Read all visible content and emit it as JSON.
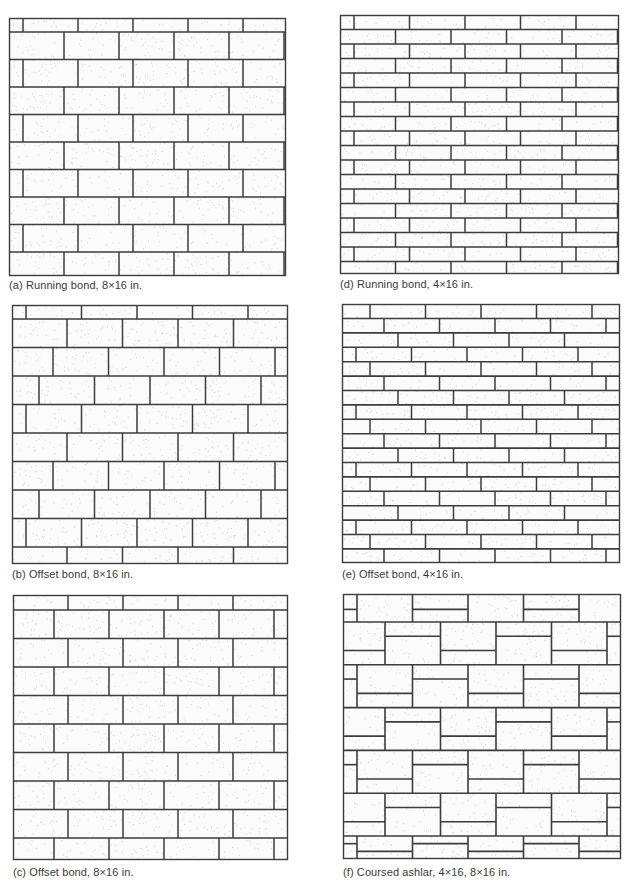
{
  "figure": {
    "background": "#ffffff",
    "line_color": "#3d3d3d",
    "brick_fill": "#fbfbfb",
    "stipple_color": "#9a9a9a",
    "panels": [
      {
        "id": "a",
        "caption": "(a) Running bond, 8×16 in.",
        "pattern": "running-bond",
        "unit": "8x16 in.",
        "box": {
          "x": 9,
          "y": 18,
          "w": 277,
          "h": 258
        },
        "caption_pos": {
          "x": 9,
          "y": 279
        },
        "brick_w": 55,
        "first_row_h": 14,
        "row_h": 27.5,
        "row_offsets": [
          14,
          0
        ],
        "base_offset": 14
      },
      {
        "id": "d",
        "caption": "(d) Running bond, 4×16 in.",
        "pattern": "running-bond",
        "unit": "4x16 in.",
        "box": {
          "x": 340,
          "y": 15,
          "w": 279,
          "h": 259
        },
        "caption_pos": {
          "x": 340,
          "y": 278
        },
        "brick_w": 55.5,
        "first_row_h": 14.5,
        "row_h": 14.5,
        "row_offsets": [
          14,
          0
        ],
        "base_offset": 14
      },
      {
        "id": "b",
        "caption": "(b) Offset bond, 8×16 in.",
        "pattern": "offset-bond-stepped-left",
        "unit": "8x16 in.",
        "box": {
          "x": 12,
          "y": 305,
          "w": 276,
          "h": 259
        },
        "caption_pos": {
          "x": 12,
          "y": 568
        },
        "brick_w": 55.5,
        "first_row_h": 14,
        "row_h": 28.5,
        "row_offsets": [
          14,
          55,
          41,
          27
        ],
        "base_offset": 14
      },
      {
        "id": "e",
        "caption": "(e) Offset bond, 4×16 in.",
        "pattern": "offset-bond-stepped-right",
        "unit": "4x16 in.",
        "box": {
          "x": 342,
          "y": 304,
          "w": 278,
          "h": 259
        },
        "caption_pos": {
          "x": 342,
          "y": 568
        },
        "brick_w": 55.5,
        "first_row_h": 14.5,
        "row_h": 14.4,
        "row_offsets": [
          28,
          42,
          56,
          14
        ],
        "base_offset": 28
      },
      {
        "id": "c",
        "caption": "(c) Offset bond, 8×16 in.",
        "pattern": "offset-bond-alternating",
        "unit": "8x16 in.",
        "box": {
          "x": 13,
          "y": 595,
          "w": 275,
          "h": 265
        },
        "caption_pos": {
          "x": 13,
          "y": 866
        },
        "brick_w": 55,
        "first_row_h": 15,
        "row_h": 28.5,
        "row_offsets": [
          55,
          41,
          55,
          41
        ],
        "base_offset": 55
      },
      {
        "id": "f",
        "caption": "(f) Coursed ashlar, 4×16, 8×16 in.",
        "pattern": "coursed-ashlar",
        "unit": "4x16, 8x16 in.",
        "box": {
          "x": 343,
          "y": 594,
          "w": 278,
          "h": 265
        },
        "caption_pos": {
          "x": 343,
          "y": 866
        },
        "brick_w": 55.5,
        "first_row_h": 28,
        "row_h": 42.8,
        "row_offsets": [
          14,
          42,
          14,
          42,
          14,
          42
        ],
        "base_offset": 14,
        "last_row_h": 14
      }
    ]
  }
}
